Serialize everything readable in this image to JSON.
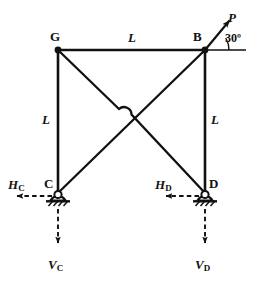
{
  "figure": {
    "width": 262,
    "height": 283,
    "stroke_color": "#111111",
    "background": "#ffffff"
  },
  "nodes": {
    "G": {
      "label": "G",
      "x": 58,
      "y": 50,
      "label_x": 50,
      "label_y": 30
    },
    "B": {
      "label": "B",
      "x": 205,
      "y": 50,
      "label_x": 193,
      "label_y": 30
    },
    "C": {
      "label": "C",
      "x": 58,
      "y": 193,
      "label_x": 44,
      "label_y": 177
    },
    "D": {
      "label": "D",
      "x": 205,
      "y": 193,
      "label_x": 209,
      "label_y": 177
    }
  },
  "members": [
    {
      "name": "top-chord-GB",
      "from": "G",
      "to": "B"
    },
    {
      "name": "left-column-GC",
      "from": "G",
      "to": "C"
    },
    {
      "name": "right-column-BD",
      "from": "B",
      "to": "D"
    },
    {
      "name": "diagonal-GD",
      "from": "G",
      "to": "D"
    },
    {
      "name": "diagonal-CB",
      "from": "C",
      "to": "B"
    }
  ],
  "dimensions": [
    {
      "name": "top-span",
      "label": "L",
      "x": 128,
      "y": 31
    },
    {
      "name": "left-height",
      "label": "L",
      "x": 42,
      "y": 113
    },
    {
      "name": "right-height",
      "label": "L",
      "x": 211,
      "y": 113
    }
  ],
  "applied_load": {
    "label": "P",
    "label_x": 228,
    "label_y": 11,
    "angle_label": "30º",
    "angle_label_x": 225,
    "angle_label_y": 32,
    "angle_degrees": 30,
    "applied_at": "B",
    "direction": "up-right"
  },
  "reactions": [
    {
      "name": "horizontal-reaction-C",
      "symbol": "H",
      "subscript": "C",
      "label_x": 8,
      "label_y": 178,
      "direction": "left",
      "at_node": "C",
      "style": "dashed"
    },
    {
      "name": "vertical-reaction-C",
      "symbol": "V",
      "subscript": "C",
      "label_x": 48,
      "label_y": 258,
      "direction": "down",
      "at_node": "C",
      "style": "dashed"
    },
    {
      "name": "horizontal-reaction-D",
      "symbol": "H",
      "subscript": "D",
      "label_x": 155,
      "label_y": 178,
      "direction": "left",
      "at_node": "D",
      "style": "dashed"
    },
    {
      "name": "vertical-reaction-D",
      "symbol": "V",
      "subscript": "D",
      "label_x": 195,
      "label_y": 258,
      "direction": "down",
      "at_node": "D",
      "style": "dashed"
    }
  ],
  "supports": [
    {
      "name": "pin-support-C",
      "at_node": "C",
      "type": "pin"
    },
    {
      "name": "pin-support-D",
      "at_node": "D",
      "type": "pin"
    }
  ]
}
